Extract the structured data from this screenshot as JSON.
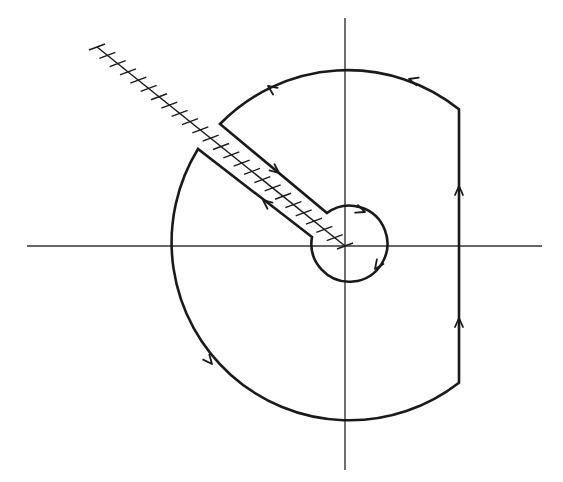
{
  "diagram": {
    "type": "keyhole-contour",
    "colors": {
      "background": "#ffffff",
      "stroke": "#1a1a1a",
      "axis": "#333333"
    },
    "axes": {
      "horizontal": {
        "x1": 27,
        "x2": 542,
        "y": 246
      },
      "vertical": {
        "x": 345,
        "y1": 18,
        "y2": 470
      }
    },
    "origin": {
      "x": 345,
      "y": 246
    },
    "outer_radius": 178,
    "inner_radius": 38,
    "vertical_segment_x": 459,
    "branch_cut": {
      "x1": 97,
      "y1": 47,
      "x2": 345,
      "y2": 246,
      "tick_count": 24
    },
    "slit": {
      "upper": {
        "outer": [
          220,
          124
        ],
        "inner": [
          327,
          213
        ]
      },
      "lower": {
        "outer": [
          198,
          149
        ],
        "inner": [
          312,
          237
        ]
      }
    },
    "arrows": [
      {
        "name": "outer-arc-top-arrow",
        "x": 409,
        "y": 79,
        "angle": 196
      },
      {
        "name": "outer-arc-upper-left-arrow",
        "x": 268,
        "y": 86,
        "angle": 215
      },
      {
        "name": "outer-arc-lower-left-arrow",
        "x": 212,
        "y": 364,
        "angle": 50
      },
      {
        "name": "vertical-segment-lower-arrow",
        "x": 459,
        "y": 318,
        "angle": 270
      },
      {
        "name": "vertical-segment-upper-arrow",
        "x": 459,
        "y": 186,
        "angle": 270
      },
      {
        "name": "slit-upper-edge-arrow",
        "x": 279,
        "y": 173,
        "angle": 39
      },
      {
        "name": "slit-lower-edge-arrow",
        "x": 263,
        "y": 200,
        "angle": 219
      },
      {
        "name": "inner-circle-top-arrow",
        "x": 365,
        "y": 212,
        "angle": 20
      },
      {
        "name": "inner-circle-right-arrow",
        "x": 375,
        "y": 269,
        "angle": 125
      }
    ]
  }
}
